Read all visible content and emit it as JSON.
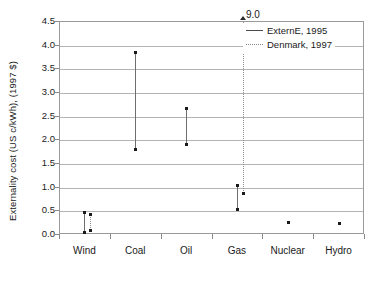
{
  "chart_data": {
    "type": "scatter",
    "title": "",
    "xlabel": "",
    "ylabel": "Externality cost (US c/kWh), (1997 $)",
    "categories": [
      "Wind",
      "Coal",
      "Oil",
      "Gas",
      "Nuclear",
      "Hydro"
    ],
    "ylim": [
      0.0,
      4.5
    ],
    "yticks": [
      "0.0",
      "0.5",
      "1.0",
      "1.5",
      "2.0",
      "2.5",
      "3.0",
      "3.5",
      "4.0",
      "4.5"
    ],
    "ytick_values": [
      0.0,
      0.5,
      1.0,
      1.5,
      2.0,
      2.5,
      3.0,
      3.5,
      4.0,
      4.5
    ],
    "grid": true,
    "legend_position": "top-right-inside",
    "series": [
      {
        "name": "ExternE, 1995",
        "style": "solid",
        "ranges": [
          {
            "category": "Wind",
            "low": 0.05,
            "high": 0.47
          },
          {
            "category": "Coal",
            "low": 1.8,
            "high": 3.85
          },
          {
            "category": "Oil",
            "low": 1.9,
            "high": 2.67
          },
          {
            "category": "Gas",
            "low": 0.53,
            "high": 1.03
          },
          {
            "category": "Nuclear",
            "low": 0.26,
            "high": 0.26
          },
          {
            "category": "Hydro",
            "low": 0.24,
            "high": 0.24
          }
        ]
      },
      {
        "name": "Denmark, 1997",
        "style": "dotted",
        "ranges": [
          {
            "category": "Wind",
            "low": 0.09,
            "high": 0.43
          },
          {
            "category": "Gas",
            "low": 0.86,
            "high": 9.0,
            "offscale_high": true,
            "offscale_label": "9.0"
          }
        ]
      }
    ],
    "annotations": [
      {
        "text": "9.0",
        "category": "Gas",
        "note": "off-scale top of Denmark, 1997 gas range"
      }
    ]
  },
  "legend": {
    "items": [
      {
        "label": "ExternE, 1995",
        "style": "solid"
      },
      {
        "label": "Denmark, 1997",
        "style": "dotted"
      }
    ]
  }
}
